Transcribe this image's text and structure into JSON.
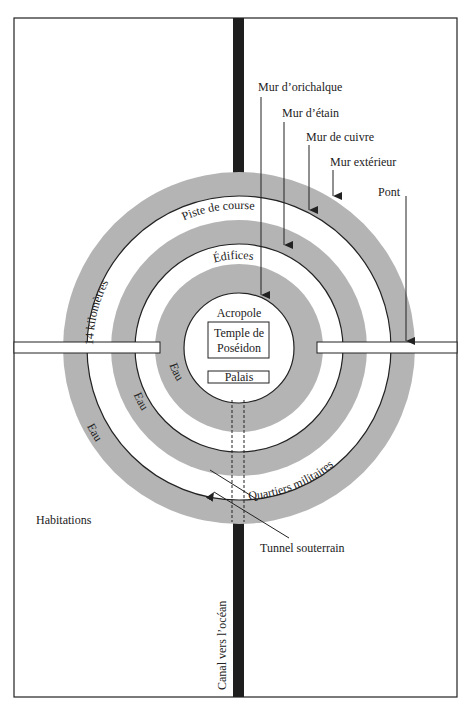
{
  "labels": {
    "mur_orichalque": "Mur d’orichalque",
    "mur_etain": "Mur d’étain",
    "mur_cuivre": "Mur de cuivre",
    "mur_exterieur": "Mur extérieur",
    "pont": "Pont",
    "piste": "Piste de course",
    "edifices": "Édifices",
    "acropole": "Acropole",
    "temple_l1": "Temple de",
    "temple_l2": "Poséidon",
    "palais": "Palais",
    "km": "14 kilomètres",
    "eau": "Eau",
    "quartiers": "Quartiers militaires",
    "habitations": "Habitations",
    "tunnel": "Tunnel souterrain",
    "canal": "Canal vers l’océan"
  },
  "colors": {
    "water": "#b4b4b4",
    "canal": "#1e1e1e",
    "line": "#222222"
  }
}
